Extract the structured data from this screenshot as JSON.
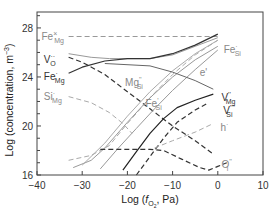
{
  "chart_data": {
    "type": "line",
    "title": "",
    "xlabel": "Log (f O2, Pa)",
    "ylabel": "Log (concentration, m^-3)",
    "xlim": [
      -40,
      10
    ],
    "ylim": [
      16,
      29.3
    ],
    "xticks": [
      -40,
      -30,
      -20,
      -10,
      0,
      10
    ],
    "yticks": [
      16,
      20,
      24,
      28
    ],
    "grid": false,
    "legend": "inline labels",
    "series": [
      {
        "name": "Fe×Mg",
        "style": "dashed",
        "color": "#999999",
        "points": [
          [
            -33,
            27.3
          ],
          [
            0,
            27.3
          ]
        ]
      },
      {
        "name": "V··O (solid)",
        "style": "solid",
        "color": "#999999",
        "points": [
          [
            -33,
            25.9
          ],
          [
            -28,
            25.6
          ],
          [
            -24,
            25.5
          ],
          [
            -15,
            25.5
          ],
          [
            -10,
            25.8
          ],
          [
            -5,
            26.5
          ],
          [
            0,
            27.2
          ]
        ]
      },
      {
        "name": "V··O (dashed)",
        "style": "dashed",
        "color": "#333333",
        "points": [
          [
            -33,
            25.6
          ],
          [
            -30,
            25.2
          ],
          [
            -25,
            24.2
          ],
          [
            -20,
            22.8
          ],
          [
            -15,
            21.4
          ],
          [
            -10,
            20.0
          ],
          [
            -5,
            18.8
          ],
          [
            -1,
            17.7
          ]
        ]
      },
      {
        "name": "Fe·Mg",
        "style": "solid",
        "color": "#333333",
        "points": [
          [
            -33,
            24.3
          ],
          [
            -30,
            24.8
          ],
          [
            -25,
            25.3
          ],
          [
            -20,
            25.5
          ],
          [
            -15,
            25.5
          ],
          [
            -10,
            25.9
          ],
          [
            -5,
            26.6
          ],
          [
            0,
            27.5
          ]
        ]
      },
      {
        "name": "Si·Mg",
        "style": "dashed",
        "color": "#aaaaaa",
        "points": [
          [
            -33,
            22.4
          ],
          [
            -28,
            21.9
          ],
          [
            -24,
            21.1
          ],
          [
            -21,
            20.2
          ],
          [
            -19,
            19.4
          ]
        ]
      },
      {
        "name": "Mg''Si",
        "style": "dashed",
        "color": "#aaaaaa",
        "points": [
          [
            -33,
            17.2
          ],
          [
            -28,
            17.6
          ],
          [
            -24,
            18.4
          ],
          [
            -20,
            20.2
          ],
          [
            -15,
            22.3
          ],
          [
            -10,
            24.2
          ],
          [
            -5,
            25.8
          ],
          [
            0,
            27.0
          ]
        ]
      },
      {
        "name": "Fe·Si",
        "style": "solid",
        "color": "#999999",
        "points": [
          [
            -32,
            16.6
          ],
          [
            -28,
            17.2
          ],
          [
            -25,
            18.2
          ],
          [
            -20,
            20.3
          ],
          [
            -15,
            22.3
          ],
          [
            -10,
            24.0
          ],
          [
            -5,
            25.4
          ],
          [
            0,
            26.5
          ]
        ]
      },
      {
        "name": "Fe'Si",
        "style": "solid",
        "color": "#999999",
        "points": [
          [
            -26,
            16.5
          ],
          [
            -22,
            18.2
          ],
          [
            -18,
            19.8
          ],
          [
            -14,
            21.4
          ],
          [
            -10,
            22.9
          ],
          [
            -5,
            24.6
          ],
          [
            0,
            26.2
          ]
        ]
      },
      {
        "name": "Mg''Si (lower)",
        "style": "solid",
        "color": "#aaaaaa",
        "points": [
          [
            -30,
            16.8
          ],
          [
            -25,
            18.6
          ],
          [
            -20,
            20.8
          ],
          [
            -15,
            22.8
          ],
          [
            -10,
            24.5
          ],
          [
            -5,
            25.9
          ],
          [
            0,
            27.0
          ]
        ]
      },
      {
        "name": "e'",
        "style": "solid",
        "color": "#666666",
        "points": [
          [
            -25,
            25.1
          ],
          [
            -15,
            24.9
          ],
          [
            -10,
            24.4
          ],
          [
            -5,
            23.7
          ],
          [
            -1,
            23.0
          ]
        ]
      },
      {
        "name": "V''Mg",
        "style": "solid",
        "color": "#222222",
        "points": [
          [
            -21,
            16.4
          ],
          [
            -18,
            17.9
          ],
          [
            -15,
            19.4
          ],
          [
            -12,
            20.6
          ],
          [
            -9,
            21.5
          ],
          [
            -5,
            22.1
          ],
          [
            -1,
            22.6
          ]
        ]
      },
      {
        "name": "V''''Si",
        "style": "dashed",
        "color": "#333333",
        "points": [
          [
            -18,
            16.0
          ],
          [
            -15,
            17.5
          ],
          [
            -12,
            19.0
          ],
          [
            -9,
            20.3
          ],
          [
            -5,
            21.3
          ],
          [
            -2,
            21.9
          ]
        ]
      },
      {
        "name": "h·",
        "style": "dashed",
        "color": "#aaaaaa",
        "points": [
          [
            -14,
            18.2
          ],
          [
            -10,
            18.8
          ],
          [
            -5,
            19.5
          ],
          [
            -1,
            20.2
          ]
        ]
      },
      {
        "name": "O''i",
        "style": "dashed",
        "color": "#333333",
        "points": [
          [
            -26,
            18.1
          ],
          [
            -20,
            18.1
          ],
          [
            -15,
            18.1
          ],
          [
            -12,
            18.0
          ],
          [
            -8,
            17.3
          ],
          [
            -4,
            16.6
          ],
          [
            -2,
            16.4
          ],
          [
            0,
            16.7
          ],
          [
            2,
            17.0
          ]
        ]
      }
    ],
    "labels": [
      {
        "text": "Fe",
        "sub": "Mg",
        "sup": "×",
        "x": -39,
        "y": 27.3
      },
      {
        "text": "V",
        "sub": "O",
        "sup": "··",
        "x": -38.5,
        "y": 25.4
      },
      {
        "text": "Fe",
        "sub": "Mg",
        "sup": "·",
        "x": -38.5,
        "y": 24.0
      },
      {
        "text": "Si",
        "sub": "Mg",
        "sup": "·",
        "x": -38.5,
        "y": 22.4
      },
      {
        "text": "Mg",
        "sub": "Si",
        "sup": "''",
        "x": -20.5,
        "y": 23.5
      },
      {
        "text": "Fe",
        "sub": "Si",
        "sup": "'",
        "x": -16,
        "y": 21.8
      },
      {
        "text": "Fe",
        "sub": "Si",
        "sup": "·",
        "x": 1.3,
        "y": 26.2
      },
      {
        "text": "e'",
        "sub": "",
        "sup": "",
        "x": -4,
        "y": 24.3
      },
      {
        "text": "V",
        "sub": "Mg",
        "sup": "''",
        "x": 0.8,
        "y": 22.3
      },
      {
        "text": "V",
        "sub": "Si",
        "sup": "''''",
        "x": 1.2,
        "y": 21.2
      },
      {
        "text": "h",
        "sub": "",
        "sup": "·",
        "x": 0.6,
        "y": 19.8
      },
      {
        "text": "O",
        "sub": "i",
        "sup": "''",
        "x": 0.8,
        "y": 16.8
      }
    ]
  }
}
